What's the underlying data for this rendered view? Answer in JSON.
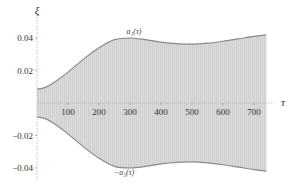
{
  "chart_data": {
    "type": "area",
    "title": "",
    "xlabel": "τ",
    "ylabel": "ξ",
    "xlim": [
      0,
      750
    ],
    "ylim": [
      -0.048,
      0.048
    ],
    "grid": false,
    "x_ticks": [
      100,
      200,
      300,
      400,
      500,
      600,
      700
    ],
    "x_tick_labels": [
      "100",
      "200",
      "300",
      "400",
      "500",
      "600",
      "700"
    ],
    "y_ticks": [
      0.04,
      0.02,
      -0.02,
      -0.04
    ],
    "y_tick_labels": [
      "0.04",
      "0.02",
      "−0.02",
      "−0.04"
    ],
    "series": [
      {
        "name": "a₁(τ)",
        "label": "a₁(τ)",
        "x": [
          0,
          25,
          50,
          100,
          150,
          200,
          250,
          300,
          350,
          400,
          450,
          500,
          550,
          600,
          650,
          700,
          740
        ],
        "values": [
          0.0085,
          0.0095,
          0.012,
          0.019,
          0.027,
          0.034,
          0.039,
          0.04,
          0.039,
          0.0375,
          0.0365,
          0.0362,
          0.0368,
          0.038,
          0.0395,
          0.041,
          0.042
        ]
      },
      {
        "name": "−a₁(τ)",
        "label": "−a₁(τ)",
        "x": [
          0,
          25,
          50,
          100,
          150,
          200,
          250,
          300,
          350,
          400,
          450,
          500,
          550,
          600,
          650,
          700,
          740
        ],
        "values": [
          -0.0085,
          -0.0095,
          -0.012,
          -0.019,
          -0.027,
          -0.034,
          -0.039,
          -0.04,
          -0.039,
          -0.0375,
          -0.0365,
          -0.0362,
          -0.0368,
          -0.038,
          -0.0395,
          -0.041,
          -0.042
        ]
      }
    ],
    "fill_between": {
      "upper": "a₁(τ)",
      "lower": "−a₁(τ)",
      "description": "dense oscillation ξ(τ) filling region between envelopes"
    },
    "annotations": [
      {
        "text": "a₁(τ)",
        "x": 270,
        "y": 0.045
      },
      {
        "text": "−a₁(τ)",
        "x": 270,
        "y": -0.049
      }
    ],
    "colors": {
      "fill": "#d9d9d9",
      "envelope": "#8a8a8a",
      "axis": "#9a9a9a",
      "text": "#333333"
    }
  },
  "labels": {
    "y_axis_title": "ξ",
    "x_axis_title": "τ",
    "upper_curve": "a₁(τ)",
    "lower_curve": "−a₁(τ)",
    "y_ticks": [
      "0.04",
      "0.02",
      "−0.02",
      "−0.04"
    ],
    "x_ticks": [
      "100",
      "200",
      "300",
      "400",
      "500",
      "600",
      "700"
    ]
  }
}
